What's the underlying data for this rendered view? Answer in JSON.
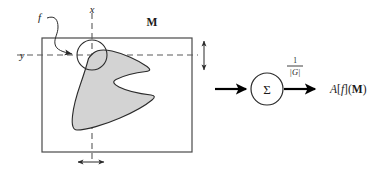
{
  "figure": {
    "domain_box": {
      "label": "M",
      "x": 42,
      "y": 38,
      "width": 150,
      "height": 114
    },
    "axes": {
      "x_label": "x",
      "y_label": "y",
      "x_line_position": 92,
      "y_line_position": 55
    },
    "input_label": "f",
    "origin_circle": {
      "center_x": 92,
      "center_y": 55,
      "radius": 15
    },
    "extent_markers": {
      "vertical_label": "",
      "horizontal_label": ""
    },
    "operator": {
      "symbol": "Σ",
      "center_x": 267,
      "center_y": 89,
      "radius": 16
    },
    "scale_factor": {
      "numerator": "1",
      "denominator": "|G|"
    },
    "output": {
      "operator_name": "A",
      "bracket_open": "[",
      "function": "f",
      "bracket_close": "]",
      "paren_open": "(",
      "domain": "M",
      "paren_close": ")",
      "full": "A[f](M)"
    },
    "colors": {
      "blob_fill": "#d3d3d3",
      "blob_stroke": "#2b2b2b",
      "box_stroke": "#4a4a4a",
      "dash_stroke": "#5a5a5a",
      "text": "#1a1a1a"
    }
  }
}
